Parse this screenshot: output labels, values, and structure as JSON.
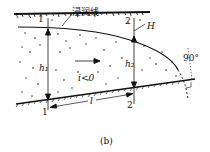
{
  "figure": {
    "caption": "(b)",
    "labels": {
      "phreatic_line": "浸润线",
      "section_1_top": "1",
      "section_1_bottom": "1",
      "section_2_top": "2",
      "section_2_bottom": "2",
      "head_h": "H",
      "depth_h1": "h₁",
      "depth_h2": "h₂",
      "slope": "i<0",
      "distance": "l",
      "angle": "90°"
    },
    "colors": {
      "ink": "#111111",
      "background": "#ffffff"
    }
  }
}
